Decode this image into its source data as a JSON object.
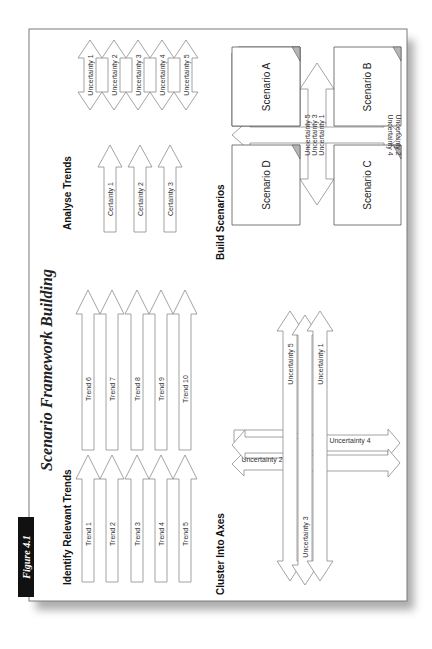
{
  "figure": {
    "badge": "Figure 4.1",
    "title": "Scenario Framework Building"
  },
  "sections": {
    "identify": {
      "heading": "Identify Relevant Trends",
      "trends": [
        "Trend 1",
        "Trend 2",
        "Trend 3",
        "Trend 4",
        "Trend 5",
        "Trend 6",
        "Trend 7",
        "Trend 8",
        "Trend 9",
        "Trend 10"
      ]
    },
    "analyse": {
      "heading": "Analyse Trends",
      "certainties": [
        "Certainty 1",
        "Certainty 2",
        "Certainty 3"
      ],
      "uncertainties": [
        "Uncertainty 1",
        "Uncertainty 2",
        "Uncertainty 3",
        "Uncertainty 4",
        "Uncertainty 5"
      ]
    },
    "cluster": {
      "heading": "Cluster Into Axes",
      "vertical_axis": [
        "Uncertainty 5",
        "Uncertainty 3",
        "Uncertainty 1"
      ],
      "horizontal_axis": [
        "Uncertainty 2",
        "Uncertainty 4"
      ]
    },
    "build": {
      "heading": "Build Scenarios",
      "scenarios": [
        "Scenario A",
        "Scenario B",
        "Scenario C",
        "Scenario D"
      ],
      "axis_a_labels": [
        "Uncertainty 5",
        "Uncertainty 3",
        "Uncertainty 1"
      ],
      "axis_b_labels": [
        "Uncertainty 2",
        "Uncertainty 4"
      ]
    }
  },
  "colors": {
    "frame": "#7a7a7a",
    "arrow_stroke": "#8c8c8c",
    "badge_bg": "#111111",
    "badge_text": "#ffffff",
    "box_stroke": "#555555"
  }
}
